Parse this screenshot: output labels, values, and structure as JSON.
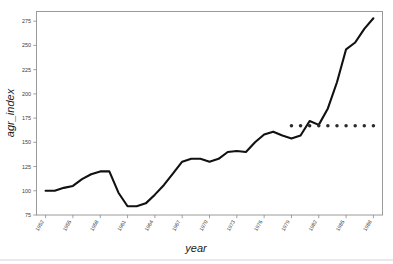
{
  "chart_data": {
    "type": "line",
    "title": "",
    "subtitle": "",
    "xlabel": "year",
    "ylabel": "agr_index",
    "xlim": [
      1951,
      1989
    ],
    "ylim": [
      75,
      285
    ],
    "grid": false,
    "legend": "none",
    "y_ticks": [
      75,
      100,
      125,
      150,
      175,
      200,
      225,
      250,
      275
    ],
    "x_ticks": [
      "1952",
      "1955",
      "1958",
      "1961",
      "1964",
      "1967",
      "1970",
      "1973",
      "1976",
      "1979",
      "1982",
      "1985",
      "1988"
    ],
    "x_tick_values": [
      1952,
      1955,
      1958,
      1961,
      1964,
      1967,
      1970,
      1973,
      1976,
      1979,
      1982,
      1985,
      1988
    ],
    "x_tick_rotation_deg": 60,
    "series": [
      {
        "name": "agr_index",
        "style": "solid",
        "color": "#111111",
        "x": [
          1952,
          1953,
          1954,
          1955,
          1956,
          1957,
          1958,
          1959,
          1960,
          1961,
          1962,
          1963,
          1964,
          1965,
          1966,
          1967,
          1968,
          1969,
          1970,
          1971,
          1972,
          1973,
          1974,
          1975,
          1976,
          1977,
          1978,
          1979,
          1980,
          1981,
          1982,
          1983,
          1984,
          1985,
          1986,
          1987,
          1988
        ],
        "values": [
          100,
          100,
          103,
          105,
          112,
          117,
          120,
          120,
          98,
          84,
          84,
          87,
          96,
          106,
          118,
          130,
          133,
          133,
          130,
          133,
          140,
          141,
          140,
          150,
          158,
          161,
          157,
          154,
          157,
          172,
          168,
          185,
          212,
          246,
          253,
          267,
          278
        ]
      },
      {
        "name": "reference level",
        "style": "dotted",
        "color": "#2b2b2b",
        "x": [
          1979,
          1980,
          1981,
          1982,
          1983,
          1984,
          1985,
          1986,
          1987,
          1988
        ],
        "values": [
          167,
          167,
          167,
          167,
          167,
          167,
          167,
          167,
          167,
          167
        ]
      }
    ],
    "annotations": []
  },
  "figure": {
    "background_color": "#ffffff",
    "frame_color": "#9a9a9a",
    "tick_color": "#8a8a8a",
    "axis_title_style": "italic"
  }
}
